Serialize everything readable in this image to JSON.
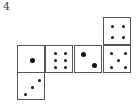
{
  "problem_number": "4",
  "faces": [
    {
      "name": "face-top",
      "x": 103,
      "y": 17,
      "pips": 4
    },
    {
      "name": "face-row-1",
      "x": 17,
      "y": 45,
      "pips": 1
    },
    {
      "name": "face-row-2",
      "x": 45,
      "y": 45,
      "pips": 6
    },
    {
      "name": "face-row-3",
      "x": 74,
      "y": 45,
      "pips": 2
    },
    {
      "name": "face-row-4",
      "x": 103,
      "y": 45,
      "pips": 5
    },
    {
      "name": "face-bottom",
      "x": 17,
      "y": 72,
      "pips": 3
    }
  ]
}
